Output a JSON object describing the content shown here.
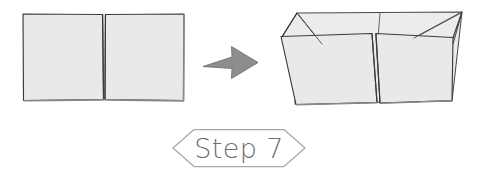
{
  "diagram": {
    "title": "Step 7",
    "type": "origami-folding-instruction",
    "background_color": "#ffffff",
    "paper_fill_color": "#e9e9e9",
    "paper_edge_color": "#3b3b3b",
    "arrow_color": "#8d8d8d",
    "badge_stroke_color": "#a8a8a8",
    "label_text_color": "#6e6e6e"
  },
  "panels": [
    {
      "id": "before",
      "name": "flat-folded-paper",
      "description": "Flat rectangular folded paper divided into two equal panels by a vertical center crease",
      "position": "left"
    },
    {
      "id": "after",
      "name": "open-box-paper",
      "description": "Paper opened into a shallow three-dimensional tray with corner flaps folded and a center split",
      "position": "right"
    }
  ],
  "arrow": {
    "name": "transform-arrow",
    "direction": "right",
    "label": ""
  },
  "step_badge": {
    "label": "Step 7",
    "step_number": "7",
    "prefix": "Step",
    "shape": "hexagon"
  }
}
